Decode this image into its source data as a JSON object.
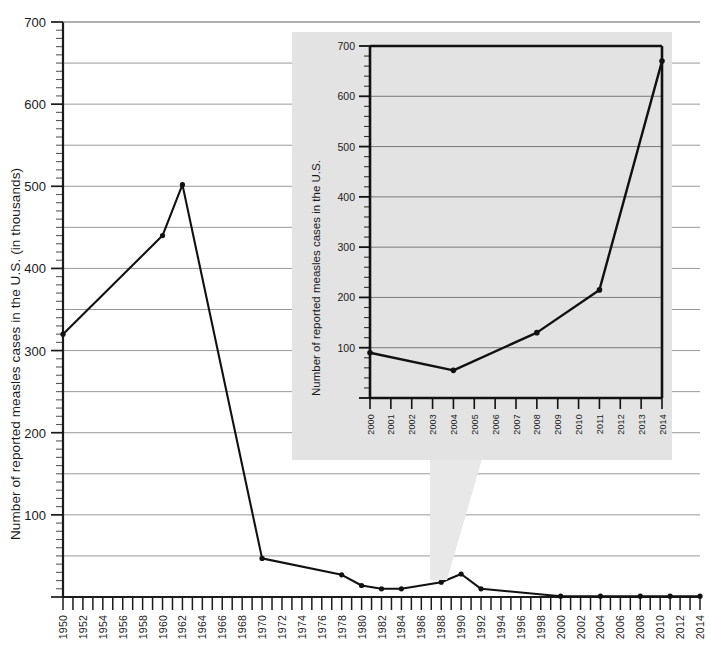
{
  "chart_data": {
    "type": "line",
    "title": "",
    "xlabel": "",
    "ylabel": "Number of reported measles cases in the U.S. (in thousands)",
    "xlim": [
      1950,
      2014
    ],
    "ylim": [
      0,
      700
    ],
    "grid": "horizontal gridlines every 50 thousand",
    "legend": "none",
    "y_ticks": [
      100,
      200,
      300,
      400,
      500,
      600,
      700
    ],
    "x_ticks": [
      1950,
      1952,
      1954,
      1956,
      1958,
      1960,
      1962,
      1964,
      1966,
      1968,
      1970,
      1972,
      1974,
      1976,
      1978,
      1980,
      1982,
      1984,
      1986,
      1988,
      1990,
      1992,
      1994,
      1996,
      1998,
      2000,
      2002,
      2004,
      2006,
      2008,
      2010,
      2012,
      2014
    ],
    "series": [
      {
        "name": "Reported measles cases (thousands)",
        "x": [
          1950,
          1960,
          1962,
          1970,
          1978,
          1980,
          1982,
          1984,
          1988,
          1990,
          1992,
          2000,
          2004,
          2008,
          2011,
          2014
        ],
        "values": [
          320,
          440,
          502,
          47,
          27,
          14,
          10,
          10,
          18,
          28,
          10,
          1,
          1,
          1,
          1,
          1
        ]
      }
    ],
    "inset": {
      "type": "line",
      "ylabel": "Number of reported measles cases in the U.S.",
      "xlabel": "",
      "xlim": [
        2000,
        2014
      ],
      "ylim": [
        0,
        700
      ],
      "grid": "horizontal gridlines every 100 cases",
      "y_ticks": [
        100,
        200,
        300,
        400,
        500,
        600,
        700
      ],
      "x_ticks": [
        2000,
        2001,
        2002,
        2003,
        2004,
        2005,
        2006,
        2007,
        2008,
        2009,
        2010,
        2011,
        2012,
        2013,
        2014
      ],
      "series": [
        {
          "name": "Reported measles cases",
          "x": [
            2000,
            2004,
            2008,
            2011,
            2014
          ],
          "values": [
            90,
            55,
            130,
            215,
            670
          ]
        }
      ]
    }
  },
  "colors": {
    "background": "#ffffff",
    "line": "#111111",
    "grid": "#8d8d8d",
    "axis": "#1b1b1b",
    "inset_panel": "#e3e3e3",
    "inset_callout": "#e8e8e8"
  }
}
